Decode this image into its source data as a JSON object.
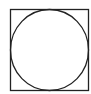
{
  "diagram": {
    "stroke_color": "#222222",
    "background": "#ffffff",
    "square": {
      "x": 10.5,
      "y": 9.5,
      "width": 78,
      "height": 81
    },
    "circle": {
      "cx": 49.5,
      "cy": 50,
      "rx": 39,
      "ry": 40.5
    }
  }
}
